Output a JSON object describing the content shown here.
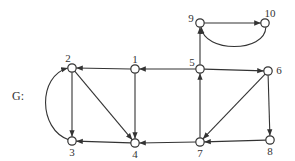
{
  "graph": {
    "name": "G:",
    "directed": true,
    "nodes": [
      {
        "id": "1",
        "x": 135,
        "y": 69,
        "label_dx": 0,
        "label_dy": -6
      },
      {
        "id": "2",
        "x": 72,
        "y": 68,
        "label_dx": -4,
        "label_dy": -6
      },
      {
        "id": "3",
        "x": 72,
        "y": 141,
        "label_dx": 0,
        "label_dy": 15
      },
      {
        "id": "4",
        "x": 135,
        "y": 143,
        "label_dx": 0,
        "label_dy": 15
      },
      {
        "id": "5",
        "x": 200,
        "y": 69,
        "label_dx": -8,
        "label_dy": -3
      },
      {
        "id": "6",
        "x": 268,
        "y": 71,
        "label_dx": 11,
        "label_dy": 3
      },
      {
        "id": "7",
        "x": 200,
        "y": 142,
        "label_dx": 0,
        "label_dy": 15
      },
      {
        "id": "8",
        "x": 270,
        "y": 140,
        "label_dx": 0,
        "label_dy": 15
      },
      {
        "id": "9",
        "x": 200,
        "y": 23,
        "label_dx": -9,
        "label_dy": -1
      },
      {
        "id": "10",
        "x": 265,
        "y": 23,
        "label_dx": 5,
        "label_dy": -6
      }
    ],
    "edges": [
      {
        "from": "5",
        "to": "1"
      },
      {
        "from": "1",
        "to": "2"
      },
      {
        "from": "1",
        "to": "4"
      },
      {
        "from": "2",
        "to": "3"
      },
      {
        "from": "2",
        "to": "4"
      },
      {
        "from": "3",
        "to": "2",
        "curved": true
      },
      {
        "from": "4",
        "to": "3"
      },
      {
        "from": "7",
        "to": "4"
      },
      {
        "from": "5",
        "to": "6"
      },
      {
        "from": "5",
        "to": "9"
      },
      {
        "from": "6",
        "to": "7"
      },
      {
        "from": "6",
        "to": "8"
      },
      {
        "from": "7",
        "to": "5"
      },
      {
        "from": "8",
        "to": "7"
      },
      {
        "from": "9",
        "to": "10"
      },
      {
        "from": "10",
        "to": "9",
        "curved": true
      }
    ],
    "colors": {
      "stroke": "#333333",
      "fill": "#ffffff"
    }
  }
}
